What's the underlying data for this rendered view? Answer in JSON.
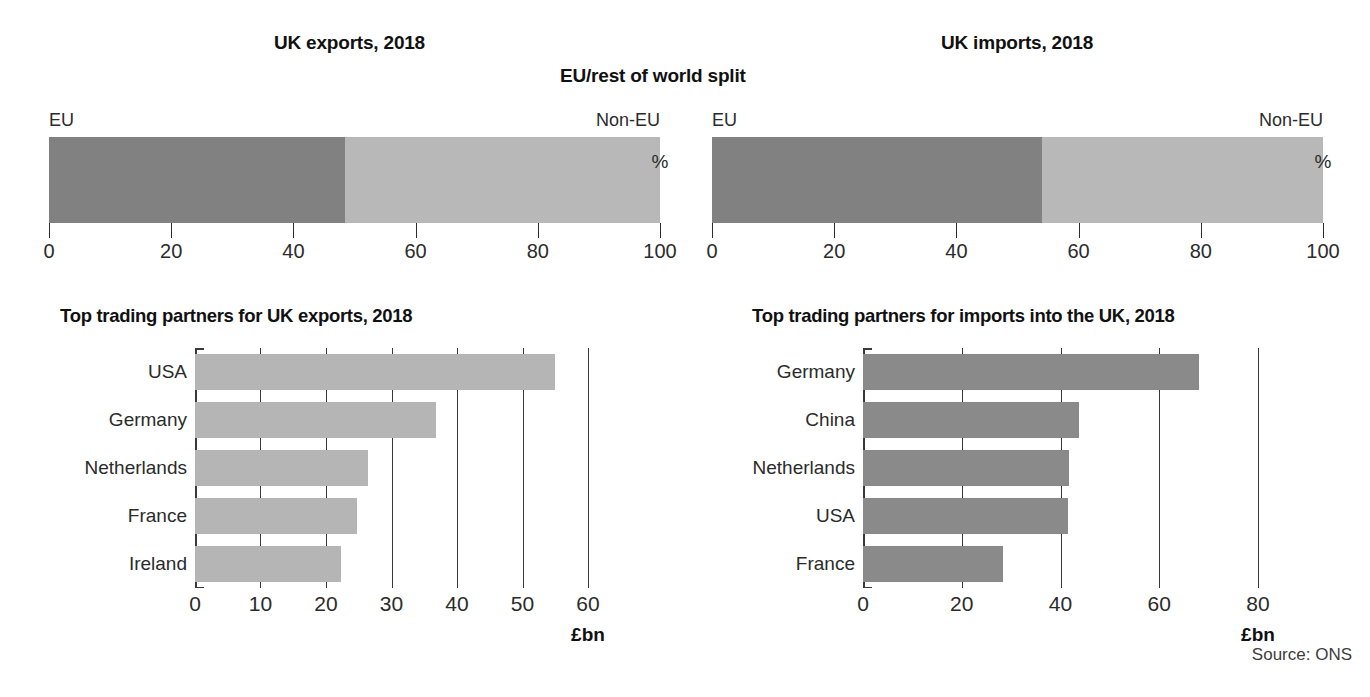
{
  "figure": {
    "source_note": "Source: ONS",
    "bottom_caption": ""
  },
  "panels": {
    "exports": {
      "title": "UK exports, 2018",
      "partners_title": "Top trading partners for UK exports, 2018"
    },
    "imports": {
      "title": "UK imports, 2018",
      "partners_title": "Top trading partners for imports into the UK, 2018"
    },
    "split_title": "EU/rest of world split"
  },
  "split_labels": {
    "eu": "EU",
    "non_eu": "Non-EU",
    "unit": "%"
  },
  "colors": {
    "eu_segment": "#818181",
    "non_eu_segment": "#b8b8b8",
    "exports_bar": "#b5b5b5",
    "imports_bar": "#8a8a8a",
    "axis": "#3a3a3a",
    "text": "#2b2b2b"
  },
  "chart_data": [
    {
      "id": "exports-split",
      "type": "bar",
      "orientation": "stacked-horizontal",
      "title": "UK exports, 2018",
      "subtitle": "EU/rest of world split",
      "xlabel": "%",
      "ylabel": "",
      "xlim": [
        0,
        100
      ],
      "ticks": [
        0,
        20,
        40,
        60,
        80,
        100
      ],
      "ticklabels": [
        "0",
        "20",
        "40",
        "60",
        "80",
        "100"
      ],
      "grid": false,
      "legend": "inline-end-labels",
      "series": [
        {
          "name": "EU",
          "value": 48.5
        },
        {
          "name": "Non-EU",
          "value": 51.5
        }
      ]
    },
    {
      "id": "imports-split",
      "type": "bar",
      "orientation": "stacked-horizontal",
      "title": "UK imports, 2018",
      "subtitle": "EU/rest of world split",
      "xlabel": "%",
      "ylabel": "",
      "xlim": [
        0,
        100
      ],
      "ticks": [
        0,
        20,
        40,
        60,
        80,
        100
      ],
      "ticklabels": [
        "0",
        "20",
        "40",
        "60",
        "80",
        "100"
      ],
      "grid": false,
      "legend": "inline-end-labels",
      "series": [
        {
          "name": "EU",
          "value": 54.0
        },
        {
          "name": "Non-EU",
          "value": 46.0
        }
      ]
    },
    {
      "id": "exports-partners",
      "type": "bar",
      "orientation": "horizontal",
      "title": "Top trading partners for UK exports, 2018",
      "xlabel": "£bn",
      "ylabel": "",
      "xlim": [
        0,
        60
      ],
      "ticks": [
        0,
        10,
        20,
        30,
        40,
        50,
        60
      ],
      "ticklabels": [
        "0",
        "10",
        "20",
        "30",
        "40",
        "50",
        "60"
      ],
      "grid": true,
      "categories": [
        "USA",
        "Germany",
        "Netherlands",
        "France",
        "Ireland"
      ],
      "values": [
        55.0,
        36.8,
        26.4,
        24.8,
        22.3
      ]
    },
    {
      "id": "imports-partners",
      "type": "bar",
      "orientation": "horizontal",
      "title": "Top trading partners for imports into the UK, 2018",
      "xlabel": "£bn",
      "ylabel": "",
      "xlim": [
        0,
        80
      ],
      "ticks": [
        0,
        20,
        40,
        60,
        80
      ],
      "ticklabels": [
        "0",
        "20",
        "40",
        "60",
        "80"
      ],
      "grid": true,
      "categories": [
        "Germany",
        "China",
        "Netherlands",
        "USA",
        "France"
      ],
      "values": [
        68.0,
        43.8,
        41.8,
        41.5,
        28.3
      ]
    }
  ]
}
